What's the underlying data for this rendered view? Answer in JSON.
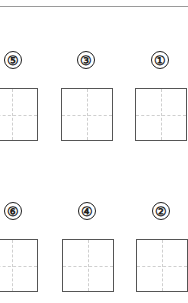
{
  "worksheet": {
    "rows": [
      {
        "items": [
          {
            "label": "⑤",
            "num_x": 4,
            "num_y": 51,
            "box_x": -14,
            "box_y": 88
          },
          {
            "label": "③",
            "num_x": 77,
            "num_y": 51,
            "box_x": 61,
            "box_y": 88
          },
          {
            "label": "①",
            "num_x": 151,
            "num_y": 51,
            "box_x": 135,
            "box_y": 88
          }
        ]
      },
      {
        "items": [
          {
            "label": "⑥",
            "num_x": 4,
            "num_y": 202,
            "box_x": -14,
            "box_y": 239
          },
          {
            "label": "④",
            "num_x": 78,
            "num_y": 202,
            "box_x": 62,
            "box_y": 239
          },
          {
            "label": "②",
            "num_x": 152,
            "num_y": 202,
            "box_x": 136,
            "box_y": 239
          }
        ]
      }
    ]
  }
}
